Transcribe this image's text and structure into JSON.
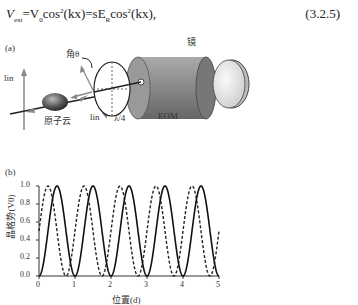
{
  "equation": {
    "text": "V_ext = V_0 cos²(kx) = sE_R cos²(kx),",
    "lhs": "V",
    "lhs_sub": "ext",
    "mid": "=V",
    "mid_sub": "0",
    "cos1": "cos",
    "arg1": "(kx)=sE",
    "sub2": "R",
    "cos2": "cos",
    "arg2": "(kx),",
    "number": "(3.2.5)"
  },
  "panel_a": {
    "label": "(a)",
    "labels": {
      "angle": "角θ",
      "mirror": "镜",
      "lin_left": "lin",
      "lin_bottom": "lin",
      "atom_cloud": "原子云",
      "waveplate": "λ/4",
      "eom": "EOM"
    }
  },
  "panel_b": {
    "label": "(b)"
  },
  "chart_data": {
    "type": "line",
    "title": "",
    "xlabel": "位置(d)",
    "ylabel": "晶格势(V0)",
    "xlim": [
      0,
      5
    ],
    "ylim": [
      0,
      1.0
    ],
    "xticks": [
      "0",
      "1",
      "2",
      "3",
      "4",
      "5"
    ],
    "yticks": [
      "0.0",
      "0.2",
      "0.4",
      "0.6",
      "0.8",
      "1.0"
    ],
    "grid": false,
    "series": [
      {
        "name": "solid",
        "style": "solid",
        "function": "sin²(πx)",
        "x": [
          0,
          0.25,
          0.5,
          0.75,
          1,
          1.5,
          2,
          2.5,
          3,
          3.5,
          4,
          4.5,
          5
        ],
        "values": [
          0,
          0.5,
          1.0,
          0.5,
          0,
          1.0,
          0,
          1.0,
          0,
          1.0,
          0,
          1.0,
          0
        ]
      },
      {
        "name": "dashed",
        "style": "dashed",
        "function": "sin²(π(x+0.25))",
        "x": [
          0,
          0.25,
          0.75,
          1.25,
          1.75,
          2.25,
          2.75,
          3.25,
          3.75,
          4.25,
          4.75,
          5
        ],
        "values": [
          0.5,
          1.0,
          0,
          1.0,
          0,
          1.0,
          0,
          1.0,
          0,
          1.0,
          0,
          0.5
        ]
      }
    ]
  }
}
